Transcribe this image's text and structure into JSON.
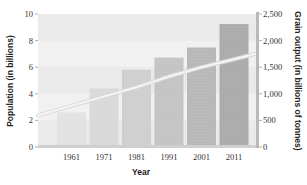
{
  "chart_data": {
    "type": "bar",
    "title": "",
    "categories": [
      "1961",
      "1971",
      "1981",
      "1991",
      "2001",
      "2011"
    ],
    "series": [
      {
        "name": "Grain output (in billions of tonnes)",
        "type": "bar",
        "axis": "right",
        "values": [
          650,
          1100,
          1450,
          1680,
          1870,
          2310
        ]
      },
      {
        "name": "Population (in billions)",
        "type": "line",
        "axis": "left",
        "values": [
          3.1,
          3.8,
          4.5,
          5.3,
          6.0,
          6.6
        ]
      }
    ],
    "xlabel": "Year",
    "ylabel": "Population (in billions)",
    "ylabel_right": "Grain output (in billions of tonnes)",
    "ylim": [
      0,
      10
    ],
    "ylim_right": [
      0,
      2500
    ],
    "yticks": [
      "0",
      "2",
      "4",
      "6",
      "8",
      "10"
    ],
    "yticks_right": [
      "0",
      "500",
      "1,000",
      "1,500",
      "2,000",
      "2,500"
    ],
    "grid": false,
    "legend": "none",
    "colors": {
      "plot_background": "#ececec",
      "bar_light": "#e0e0e0",
      "bar_dark": "#a9a9a9",
      "line": "#f4f4f4",
      "axis": "#9a9a9a"
    }
  }
}
